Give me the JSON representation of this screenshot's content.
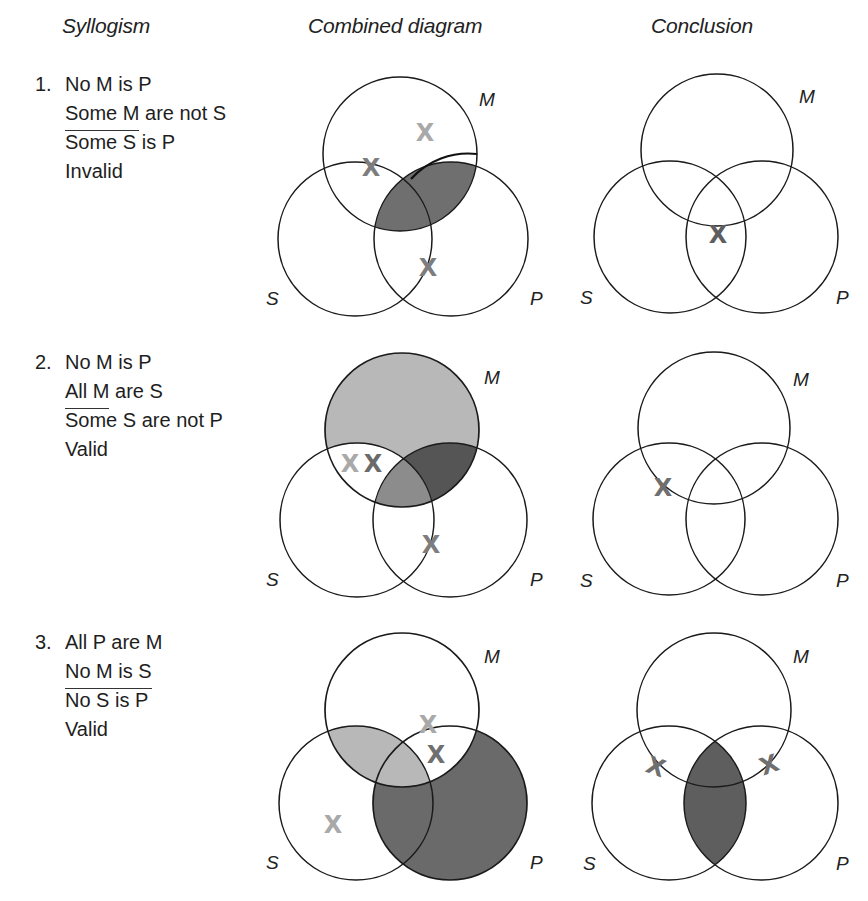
{
  "headers": {
    "syllogism": "Syllogism",
    "combined": "Combined diagram",
    "conclusion": "Conclusion"
  },
  "rows": [
    {
      "number": "1.",
      "premise1": "No M is P",
      "premise2_underlined": "Some M",
      "premise2_rest": " are not S",
      "conclusion": "Some S is P",
      "verdict": "Invalid"
    },
    {
      "number": "2.",
      "premise1": "No M is P",
      "premise2_underlined": "All M",
      "premise2_rest": " are S",
      "conclusion": "Some S are not P",
      "verdict": "Valid"
    },
    {
      "number": "3.",
      "premise1": "All P are M",
      "premise2_underlined": "No M is S",
      "premise2_rest": "",
      "conclusion": "No S is P",
      "verdict": "Valid"
    }
  ],
  "circle_labels": {
    "m": "M",
    "s": "S",
    "p": "P"
  },
  "x_mark": "X",
  "colors": {
    "outline": "#1a1a1a",
    "shade_light": "#b8b8b8",
    "shade_medium": "#8c8c8c",
    "shade_dark": "#5e5e5e",
    "x_light": "#a9a9a9",
    "x_medium": "#7d7d7d",
    "x_dark": "#6a6a6a"
  },
  "diagrams": {
    "row1_combined": {
      "shaded_regions": [
        "M∩P (dark)"
      ],
      "x_marks": [
        "M only (light)",
        "on M/S boundary",
        "on S/P boundary"
      ]
    },
    "row1_conclusion": {
      "shaded_regions": [],
      "x_marks": [
        "S∩P∩M center"
      ]
    },
    "row2_combined": {
      "shaded_regions": [
        "M only (light)",
        "M∩P∩S (medium)",
        "M∩P not S (dark)"
      ],
      "x_marks": [
        "M∩S not P (light)",
        "M∩S not P (dark)",
        "on S/P boundary"
      ]
    },
    "row2_conclusion": {
      "shaded_regions": [],
      "x_marks": [
        "on M/S boundary"
      ]
    },
    "row3_combined": {
      "shaded_regions": [
        "M∩S (light)",
        "P not M (dark)"
      ],
      "x_marks": [
        "M∩P not S (light)",
        "M∩P not S (medium)",
        "S only (light)"
      ]
    },
    "row3_conclusion": {
      "shaded_regions": [
        "S∩P (dark)"
      ],
      "x_marks": [
        "on S/M boundary",
        "on P/M boundary"
      ]
    }
  }
}
